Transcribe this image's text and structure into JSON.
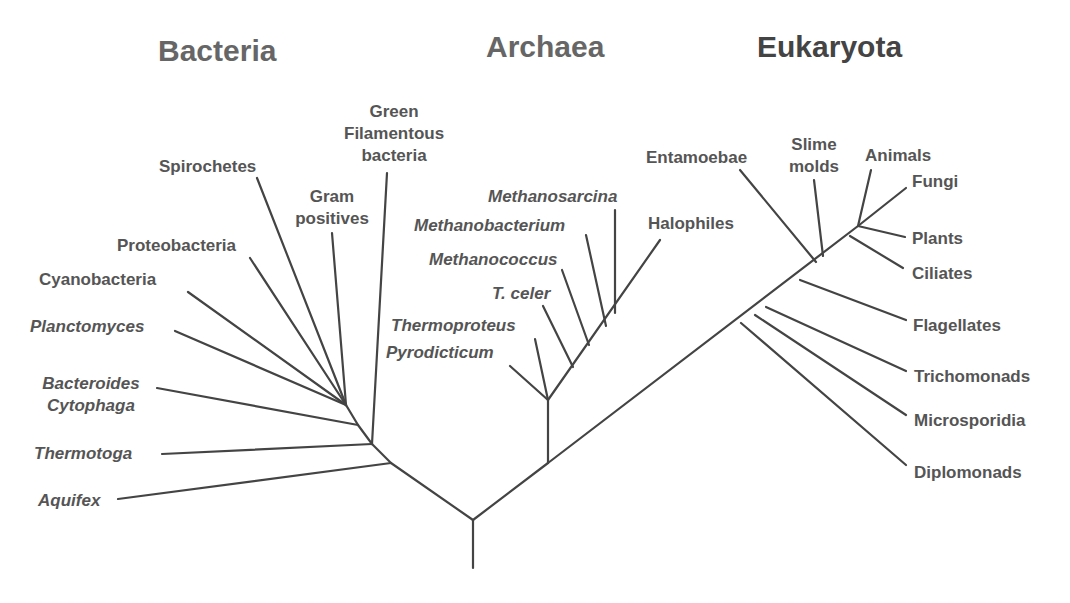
{
  "domains": {
    "bacteria": "Bacteria",
    "archaea": "Archaea",
    "eukaryota": "Eukaryota"
  },
  "colors": {
    "line": "#444444",
    "text": "#555555",
    "domain_title": "#666666",
    "eukaryota_title": "#444444"
  },
  "bacteria": [
    {
      "label": "Green",
      "label2": "Filamentous",
      "label3": "bacteria"
    },
    {
      "label": "Spirochetes"
    },
    {
      "label": "Gram",
      "label2": "positives"
    },
    {
      "label": "Proteobacteria"
    },
    {
      "label": "Cyanobacteria"
    },
    {
      "label": "Planctomyces",
      "italic": true
    },
    {
      "label": "Bacteroides",
      "label2": "Cytophaga",
      "italic": true
    },
    {
      "label": "Thermotoga",
      "italic": true
    },
    {
      "label": "Aquifex",
      "italic": true
    }
  ],
  "archaea": [
    {
      "label": "Methanosarcina",
      "italic": true
    },
    {
      "label": "Methanobacterium",
      "italic": true
    },
    {
      "label": "Halophiles"
    },
    {
      "label": "Methanococcus",
      "italic": true
    },
    {
      "label": "T. celer",
      "italic": true
    },
    {
      "label": "Thermoproteus",
      "italic": true
    },
    {
      "label": "Pyrodicticum",
      "italic": true
    }
  ],
  "eukaryota": [
    {
      "label": "Entamoebae"
    },
    {
      "label": "Slime",
      "label2": "molds"
    },
    {
      "label": "Animals"
    },
    {
      "label": "Fungi"
    },
    {
      "label": "Plants"
    },
    {
      "label": "Ciliates"
    },
    {
      "label": "Flagellates"
    },
    {
      "label": "Trichomonads"
    },
    {
      "label": "Microsporidia"
    },
    {
      "label": "Diplomonads"
    }
  ]
}
